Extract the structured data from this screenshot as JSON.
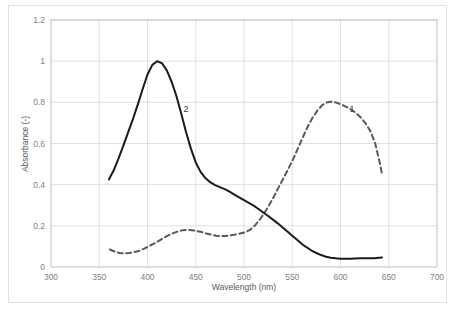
{
  "figure": {
    "background_color": "#ffffff",
    "frame_color": "#e2e2e2"
  },
  "chart_data": {
    "type": "line",
    "title": "",
    "subtitle": "",
    "xlabel": "Wavelength (nm)",
    "ylabel": "Absorbance (-)",
    "xlim": [
      300,
      700
    ],
    "ylim": [
      0,
      1.2
    ],
    "xticks": [
      300,
      350,
      400,
      450,
      500,
      550,
      600,
      650,
      700
    ],
    "xtick_labels": [
      "300",
      "350",
      "400",
      "450",
      "500",
      "550",
      "600",
      "650",
      "700"
    ],
    "yticks": [
      0,
      0.2,
      0.4,
      0.6,
      0.8,
      1,
      1.2
    ],
    "ytick_labels": [
      "0",
      "0.2",
      "0.4",
      "0.6",
      "0.8",
      "1",
      "1.2"
    ],
    "grid": true,
    "grid_color": "#d9d9d9",
    "legend_position": "inline-annotations",
    "annotations": [
      {
        "text": "1",
        "x": 612,
        "y": 0.755,
        "series": "1"
      },
      {
        "text": "2",
        "x": 440,
        "y": 0.755,
        "series": "2"
      }
    ],
    "series": [
      {
        "name": "1",
        "label": "1",
        "style": "dashed",
        "color": "#595959",
        "linewidth": 2,
        "x": [
          361,
          366,
          371,
          376,
          381,
          386,
          391,
          396,
          401,
          406,
          411,
          416,
          421,
          426,
          431,
          436,
          441,
          446,
          451,
          456,
          461,
          466,
          471,
          476,
          481,
          486,
          491,
          496,
          501,
          506,
          511,
          516,
          521,
          526,
          531,
          536,
          541,
          546,
          551,
          556,
          561,
          566,
          571,
          576,
          581,
          586,
          591,
          596,
          601,
          606,
          611,
          616,
          621,
          626,
          631,
          636,
          641,
          643
        ],
        "y": [
          0.085,
          0.075,
          0.068,
          0.066,
          0.068,
          0.072,
          0.078,
          0.088,
          0.1,
          0.112,
          0.125,
          0.139,
          0.152,
          0.163,
          0.172,
          0.178,
          0.18,
          0.179,
          0.175,
          0.17,
          0.163,
          0.157,
          0.152,
          0.15,
          0.151,
          0.154,
          0.158,
          0.163,
          0.168,
          0.18,
          0.2,
          0.228,
          0.262,
          0.3,
          0.342,
          0.388,
          0.432,
          0.478,
          0.525,
          0.578,
          0.63,
          0.682,
          0.725,
          0.76,
          0.786,
          0.8,
          0.803,
          0.798,
          0.789,
          0.778,
          0.765,
          0.748,
          0.726,
          0.698,
          0.66,
          0.6,
          0.5,
          0.452
        ]
      },
      {
        "name": "2",
        "label": "2",
        "style": "solid",
        "color": "#1a1a1a",
        "linewidth": 2,
        "x": [
          360,
          365,
          370,
          375,
          380,
          385,
          390,
          395,
          400,
          405,
          410,
          415,
          420,
          425,
          430,
          435,
          440,
          445,
          450,
          455,
          460,
          465,
          470,
          475,
          480,
          485,
          490,
          495,
          500,
          505,
          510,
          515,
          520,
          525,
          530,
          535,
          540,
          545,
          550,
          555,
          560,
          565,
          570,
          575,
          580,
          585,
          590,
          595,
          600,
          605,
          610,
          615,
          620,
          625,
          630,
          635,
          640,
          643
        ],
        "y": [
          0.425,
          0.47,
          0.528,
          0.59,
          0.655,
          0.72,
          0.79,
          0.865,
          0.935,
          0.982,
          1.0,
          0.99,
          0.955,
          0.9,
          0.83,
          0.745,
          0.655,
          0.575,
          0.508,
          0.462,
          0.432,
          0.412,
          0.398,
          0.388,
          0.378,
          0.366,
          0.352,
          0.338,
          0.325,
          0.312,
          0.298,
          0.282,
          0.265,
          0.248,
          0.23,
          0.212,
          0.192,
          0.172,
          0.152,
          0.132,
          0.112,
          0.095,
          0.08,
          0.068,
          0.058,
          0.05,
          0.045,
          0.042,
          0.04,
          0.04,
          0.04,
          0.041,
          0.042,
          0.042,
          0.042,
          0.043,
          0.045,
          0.046
        ]
      }
    ]
  }
}
